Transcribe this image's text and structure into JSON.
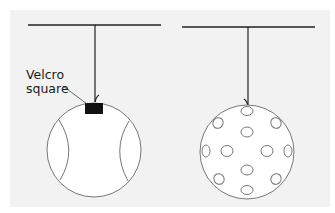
{
  "figure": {
    "left_ball": {
      "type": "tennis-ball",
      "annotation": "Velcro\nsquare",
      "annotation_lines": [
        "Velcro",
        "square"
      ]
    },
    "right_ball": {
      "type": "wiffle-ball"
    }
  },
  "colors": {
    "panel_background": "#f2f2f2",
    "line": "#222222",
    "ball_outline": "#777777",
    "velcro": "#111111"
  }
}
